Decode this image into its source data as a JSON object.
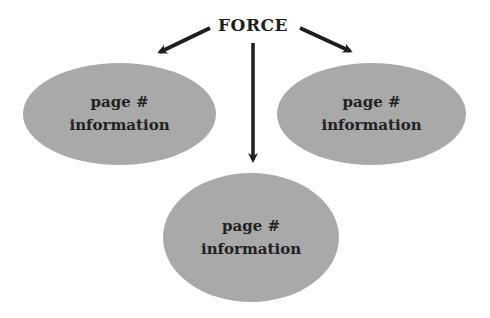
{
  "diagram": {
    "title": "FORCE",
    "nodes": [
      {
        "id": "left",
        "line1": "page #",
        "line2": "information"
      },
      {
        "id": "right",
        "line1": "page #",
        "line2": "information"
      },
      {
        "id": "bottom",
        "line1": "page #",
        "line2": "information"
      }
    ],
    "edges": [
      {
        "from": "FORCE",
        "to": "left"
      },
      {
        "from": "FORCE",
        "to": "right"
      },
      {
        "from": "FORCE",
        "to": "bottom"
      }
    ],
    "colors": {
      "node_fill": "#a9a9a9",
      "text": "#222222",
      "arrow": "#1e1e1e",
      "background": "#ffffff"
    }
  }
}
